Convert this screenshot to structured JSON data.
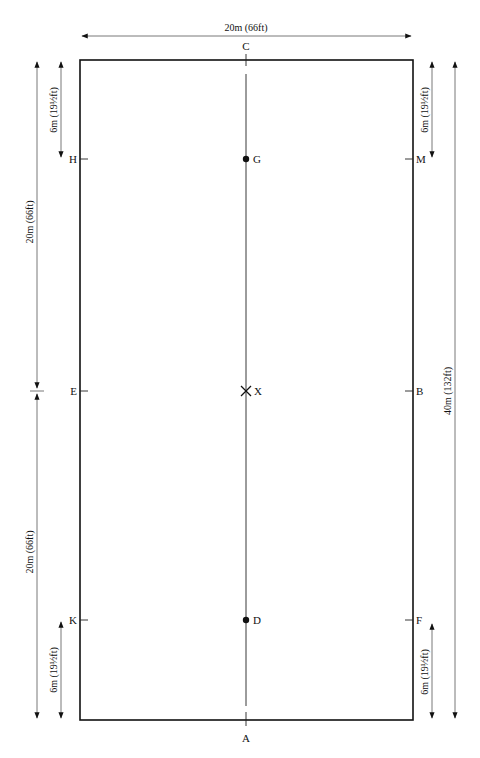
{
  "diagram": {
    "type": "dressage-arena",
    "colors": {
      "line": "#111111",
      "dim_line": "#555555",
      "background": "#ffffff"
    },
    "arena": {
      "x": 80,
      "y": 60,
      "width": 333,
      "height": 660
    },
    "centerline_x": 246,
    "top_dimension": {
      "label": "20m (66ft)"
    },
    "markers": {
      "C": "C",
      "A": "A",
      "H": "H",
      "M": "M",
      "E": "E",
      "B": "B",
      "K": "K",
      "F": "F",
      "G": "G",
      "X": "X",
      "D": "D"
    },
    "left_dimensions": {
      "top_short": "6m (19½ft)",
      "upper_long": "20m (66ft)",
      "lower_long": "20m (66ft)",
      "bottom_short": "6m (19½ft)"
    },
    "right_dimensions": {
      "top_short": "6m (19½ft)",
      "total": "40m (132ft)",
      "bottom_short": "6m (19½ft)"
    }
  }
}
